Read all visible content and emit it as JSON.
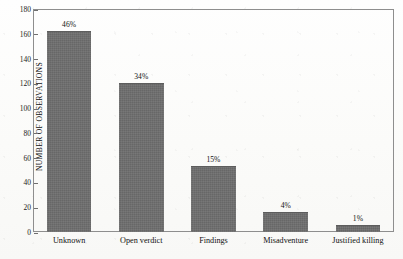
{
  "chart_data": {
    "type": "bar",
    "title": "",
    "subtitle": "",
    "xlabel": "",
    "ylabel": "NUMBER OF OBSERVATIONS",
    "categories": [
      "Unknown",
      "Open verdict",
      "Findings",
      "Misadventure",
      "Justified killing"
    ],
    "values": [
      162,
      120,
      53,
      16,
      6
    ],
    "data_labels": [
      "46%",
      "34%",
      "15%",
      "4%",
      "1%"
    ],
    "ylim": [
      0,
      180
    ],
    "yticks": [
      0,
      20,
      40,
      60,
      80,
      100,
      120,
      140,
      160,
      180
    ],
    "ytick_labels": [
      "0",
      "20",
      "40",
      "60",
      "80",
      "100",
      "120",
      "140",
      "160",
      "180"
    ],
    "grid": false,
    "legend": false,
    "legend_position": "none",
    "bar_color": "#6e6e6e",
    "frame_color": "#8e8e8e",
    "background_color": "#fdfdfb",
    "text_color": "#111111"
  }
}
